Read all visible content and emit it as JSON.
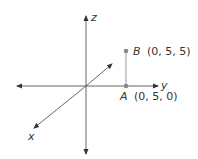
{
  "diagram": {
    "type": "3d-coordinate-axes",
    "axes": {
      "z": {
        "label": "z"
      },
      "y": {
        "label": "y"
      },
      "x": {
        "label": "x"
      }
    },
    "points": [
      {
        "name": "B",
        "coords": "(0, 5, 5)"
      },
      {
        "name": "A",
        "coords": "(0, 5, 0)"
      }
    ],
    "colors": {
      "axis": "#444444",
      "point": "#888888",
      "segment": "#aaaaaa",
      "text": "#333333"
    }
  }
}
